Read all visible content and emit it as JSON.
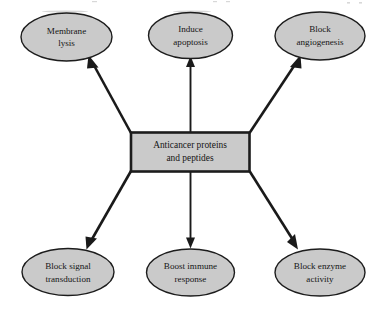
{
  "diagram": {
    "type": "radial-hub-and-spoke",
    "colors": {
      "node_fill": "#cacaca",
      "node_stroke": "#1c1c1c",
      "arrow": "#1a1a1a",
      "background": "#ffffff",
      "text": "#151515"
    },
    "center": {
      "shape": "rectangle",
      "line1": "Anticancer proteins",
      "line2": "and peptides"
    },
    "nodes": [
      {
        "id": "membrane-lysis",
        "shape": "ellipse",
        "position": "top-left",
        "line1": "Membrane",
        "line2": "lysis",
        "arrow": "outward-diagonal-up-left"
      },
      {
        "id": "induce-apoptosis",
        "shape": "ellipse",
        "position": "top-center",
        "line1": "Induce",
        "line2": "apoptosis",
        "arrow": "outward-vertical-up"
      },
      {
        "id": "block-angiogenesis",
        "shape": "ellipse",
        "position": "top-right",
        "line1": "Block",
        "line2": "angiogenesis",
        "arrow": "outward-diagonal-up-right"
      },
      {
        "id": "block-signal-transduction",
        "shape": "ellipse",
        "position": "bottom-left",
        "line1": "Block signal",
        "line2": "transduction",
        "arrow": "outward-diagonal-down-left"
      },
      {
        "id": "boost-immune-response",
        "shape": "ellipse",
        "position": "bottom-center",
        "line1": "Boost immune",
        "line2": "response",
        "arrow": "outward-vertical-down"
      },
      {
        "id": "block-enzyme-activity",
        "shape": "ellipse",
        "position": "bottom-right",
        "line1": "Block enzyme",
        "line2": "activity",
        "arrow": "outward-diagonal-down-right"
      }
    ]
  }
}
